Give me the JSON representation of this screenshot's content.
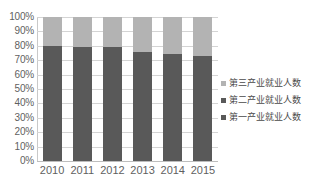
{
  "chart_data": {
    "type": "bar",
    "subtype": "stacked-percent",
    "title": "",
    "xlabel": "",
    "ylabel": "",
    "categories": [
      "2010",
      "2011",
      "2012",
      "2013",
      "2014",
      "2015"
    ],
    "ylim": [
      0,
      100
    ],
    "y_tick_labels": [
      "0%",
      "10%",
      "20%",
      "30%",
      "40%",
      "50%",
      "60%",
      "70%",
      "80%",
      "90%",
      "100%"
    ],
    "y_tick_values": [
      0,
      10,
      20,
      30,
      40,
      50,
      60,
      70,
      80,
      90,
      100
    ],
    "grid": true,
    "legend_position": "right",
    "series": [
      {
        "name": "第一产业就业人数",
        "color": "#595959",
        "values": [
          0,
          0,
          0,
          0,
          0,
          0
        ]
      },
      {
        "name": "第二产业就业人数",
        "color": "#595959",
        "values": [
          80,
          79.5,
          79,
          76,
          74,
          73
        ]
      },
      {
        "name": "第三产业就业人数",
        "color": "#b3b3b3",
        "values": [
          20,
          20.5,
          21,
          24,
          26,
          27
        ]
      }
    ]
  },
  "legend": {
    "items": [
      {
        "label": "第三产业就业人数",
        "color": "#b3b3b3"
      },
      {
        "label": "第二产业就业人数",
        "color": "#595959"
      },
      {
        "label": "第一产业就业人数",
        "color": "#595959"
      }
    ]
  },
  "colors": {
    "tertiary_industry": "#b3b3b3",
    "secondary_industry": "#595959",
    "primary_industry": "#595959",
    "gridline": "#d4d4d4",
    "axis": "#c9c9c9",
    "text": "#5f5f5f",
    "background": "#ffffff"
  }
}
